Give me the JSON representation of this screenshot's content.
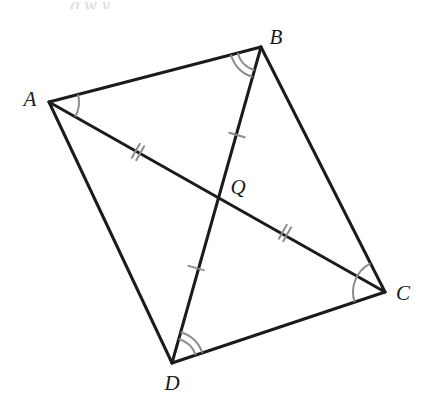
{
  "figure": {
    "background_color": "#ffffff",
    "stroke_color": "#1b1b1b",
    "arc_color": "#8c8c8c",
    "tick_color": "#8c8c8c",
    "stroke_width": 3,
    "width": 432,
    "height": 414
  },
  "labels": {
    "a": "A",
    "b": "B",
    "c": "C",
    "d": "D",
    "q": "Q"
  },
  "label_positions": {
    "a": {
      "x": 30,
      "y": 99
    },
    "b": {
      "x": 276,
      "y": 37
    },
    "c": {
      "x": 403,
      "y": 293
    },
    "d": {
      "x": 172,
      "y": 383
    },
    "q": {
      "x": 238,
      "y": 187
    }
  },
  "points": {
    "A": {
      "x": 49,
      "y": 102
    },
    "B": {
      "x": 261,
      "y": 47
    },
    "C": {
      "x": 385,
      "y": 292
    },
    "D": {
      "x": 172,
      "y": 363
    },
    "Q": {
      "x": 218,
      "y": 198
    }
  },
  "segments": [
    {
      "name": "AB",
      "from": "A",
      "to": "B",
      "kind": "side"
    },
    {
      "name": "BC",
      "from": "B",
      "to": "C",
      "kind": "side"
    },
    {
      "name": "CD",
      "from": "C",
      "to": "D",
      "kind": "side"
    },
    {
      "name": "DA",
      "from": "D",
      "to": "A",
      "kind": "side"
    },
    {
      "name": "AC",
      "from": "A",
      "to": "C",
      "kind": "diagonal"
    },
    {
      "name": "BD",
      "from": "B",
      "to": "D",
      "kind": "diagonal"
    }
  ],
  "tick_marks": [
    {
      "name": "tick-AQ",
      "segment": "AQ",
      "count": 2,
      "x": 138,
      "y": 152
    },
    {
      "name": "tick-QC",
      "segment": "QC",
      "count": 2,
      "x": 285,
      "y": 233
    },
    {
      "name": "tick-BQ",
      "segment": "BQ",
      "count": 1,
      "x": 237,
      "y": 135
    },
    {
      "name": "tick-QD",
      "segment": "QD",
      "count": 1,
      "x": 196,
      "y": 268
    }
  ],
  "angle_arcs": [
    {
      "name": "angle-A",
      "vertex": "A",
      "rays": [
        "B",
        "C"
      ],
      "count": 1,
      "radius": 30
    },
    {
      "name": "angle-B",
      "vertex": "B",
      "rays": [
        "A",
        "D"
      ],
      "count": 2,
      "radius": 31
    },
    {
      "name": "angle-C",
      "vertex": "C",
      "rays": [
        "B",
        "D"
      ],
      "count": 1,
      "radius": 32
    },
    {
      "name": "angle-D",
      "vertex": "D",
      "rays": [
        "B",
        "C"
      ],
      "count": 2,
      "radius": 32
    }
  ],
  "top_artifact": {
    "text": "g    w    y",
    "x": 70,
    "y": 0
  }
}
